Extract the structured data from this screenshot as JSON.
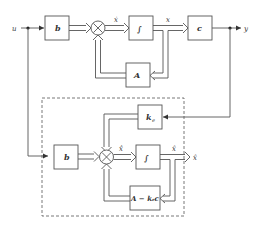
{
  "diagram": {
    "type": "block-diagram",
    "signals": {
      "input": "u",
      "output": "y",
      "state": "x",
      "state_dot": "ẋ",
      "est_state": "x̂",
      "est_state_dot": "x̂̇",
      "est_output": "x̂"
    },
    "plant": {
      "blocks": {
        "b": "b",
        "integrator": "∫",
        "c": "c",
        "A": "A"
      }
    },
    "observer": {
      "blocks": {
        "b": "b",
        "ke": "k",
        "ke_sub": "e",
        "integrator": "∫",
        "feedback_A": "A",
        "feedback_minus": " − ",
        "feedback_k": "k",
        "feedback_k_sub": "e",
        "feedback_c": "c"
      }
    },
    "summing_symbol": "×",
    "colors": {
      "line": "#555555",
      "text": "#333333",
      "background": "#ffffff"
    }
  }
}
